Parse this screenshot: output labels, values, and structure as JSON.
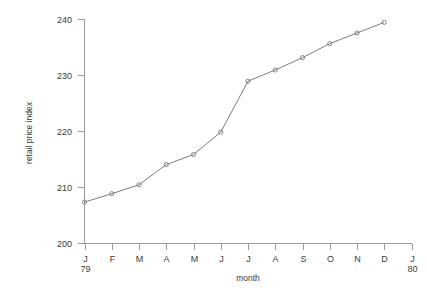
{
  "chart_data": {
    "type": "line",
    "title": "",
    "xlabel": "month",
    "ylabel": "retail price index",
    "categories": [
      "J",
      "F",
      "M",
      "A",
      "M",
      "J",
      "J",
      "A",
      "S",
      "O",
      "N",
      "D"
    ],
    "x_tick_labels": [
      "J",
      "F",
      "M",
      "A",
      "M",
      "J",
      "J",
      "A",
      "S",
      "O",
      "N",
      "D",
      "J"
    ],
    "x_tick_sublabels": [
      "79",
      "",
      "",
      "",
      "",
      "",
      "",
      "",
      "",
      "",
      "",
      "",
      "80"
    ],
    "y_tick_labels": [
      "200",
      "210",
      "220",
      "230",
      "240"
    ],
    "y_ticks": [
      200,
      210,
      220,
      230,
      240
    ],
    "ylim": [
      200,
      240
    ],
    "xlim": [
      0,
      12
    ],
    "grid": false,
    "legend": "none",
    "marker": "open-circle",
    "line_color": "#6e6e6e",
    "axis_color": "#9a9a9a",
    "text_color": "#3a3a3a",
    "background": "#ffffff",
    "x": [
      0,
      1,
      2,
      3,
      4,
      5,
      6,
      7,
      8,
      9,
      10,
      11
    ],
    "values": [
      207.3,
      208.8,
      210.4,
      214.0,
      215.8,
      219.8,
      228.9,
      230.9,
      233.1,
      235.6,
      237.5,
      239.4
    ],
    "series": [
      {
        "name": "retail price index",
        "values": [
          207.3,
          208.8,
          210.4,
          214.0,
          215.8,
          219.8,
          228.9,
          230.9,
          233.1,
          235.6,
          237.5,
          239.4
        ]
      }
    ]
  },
  "axes": {
    "x_title": "month",
    "y_title": "retail price index"
  }
}
